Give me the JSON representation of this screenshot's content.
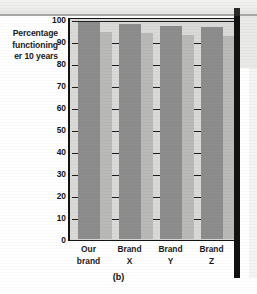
{
  "figure": {
    "caption": "(b)",
    "axis_caption_lines": [
      "Percentage",
      "functioning",
      "er 10 years"
    ]
  },
  "chart_data": {
    "type": "bar",
    "title": "",
    "xlabel": "",
    "ylabel": "Percentage functioning over 10 years",
    "categories": [
      "Our brand",
      "Brand X",
      "Brand Y",
      "Brand Z"
    ],
    "category_lines": [
      [
        "Our",
        "brand"
      ],
      [
        "Brand",
        "X"
      ],
      [
        "Brand",
        "Y"
      ],
      [
        "Brand",
        "Z"
      ]
    ],
    "values": [
      98.5,
      97.5,
      96.5,
      96
    ],
    "side_values": [
      94,
      93.5,
      92.5,
      92
    ],
    "ylim": [
      0,
      100
    ],
    "yticks": [
      0,
      10,
      20,
      30,
      40,
      50,
      60,
      70,
      80,
      90,
      100
    ],
    "ytick_labels": [
      "0",
      "10",
      "20",
      "30",
      "40",
      "50",
      "60",
      "70",
      "80",
      "90",
      "100"
    ],
    "grid": true,
    "legend": "none",
    "series": [
      {
        "name": "Percentage functioning over 10 years",
        "values": [
          98.5,
          97.5,
          96.5,
          96
        ]
      }
    ]
  },
  "colors": {
    "bar_face": "#8d8d8d",
    "bar_side": "#b9b9b7",
    "plot_background": "#d9d9d7",
    "axis": "#141414",
    "gridline": "#1d1d1d",
    "page_edge": "#111111",
    "text": "#1b1b1b"
  }
}
